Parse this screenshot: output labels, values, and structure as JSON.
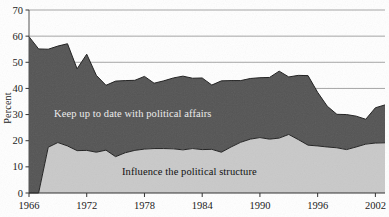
{
  "chart_data": {
    "type": "area",
    "stacked": true,
    "title": "",
    "subtitle": "",
    "xlabel": "",
    "ylabel": "Percent",
    "ylim": [
      0,
      70
    ],
    "ytick_step": 10,
    "yticks": [
      0,
      10,
      20,
      30,
      40,
      50,
      60,
      70
    ],
    "ytick_labels": [
      "0",
      "10",
      "20",
      "30",
      "40",
      "50",
      "60",
      "70"
    ],
    "xlim": [
      1966,
      2003
    ],
    "xticks": [
      1966,
      1972,
      1978,
      1984,
      1990,
      1996,
      2002
    ],
    "xtick_labels": [
      "1966",
      "1972",
      "1978",
      "1984",
      "1990",
      "1996",
      "2002"
    ],
    "grid": "horizontal-gridlines-at-40-50-60-70",
    "legend_position": "inline-annotations",
    "annotations": [
      {
        "text": "Keep up to date with political affairs",
        "color": "#ececec",
        "band": "upper"
      },
      {
        "text": "Influence the political structure",
        "color": "#111111",
        "band": "lower"
      }
    ],
    "x": [
      1966,
      1967,
      1968,
      1969,
      1970,
      1971,
      1972,
      1973,
      1974,
      1975,
      1976,
      1977,
      1978,
      1979,
      1980,
      1981,
      1982,
      1983,
      1984,
      1985,
      1986,
      1987,
      1988,
      1989,
      1990,
      1991,
      1992,
      1993,
      1994,
      1995,
      1996,
      1997,
      1998,
      1999,
      2000,
      2001,
      2002,
      2003
    ],
    "series": [
      {
        "name": "Influence the political structure",
        "color": "#c9c9c9",
        "values": [
          0,
          0,
          17.5,
          19.3,
          18.0,
          16.2,
          16.3,
          15.6,
          16.4,
          13.9,
          15.4,
          16.3,
          16.8,
          17.0,
          17.0,
          16.9,
          16.5,
          17.0,
          16.6,
          16.7,
          15.6,
          17.6,
          19.4,
          20.6,
          21.2,
          20.6,
          21.0,
          22.4,
          20.4,
          18.3,
          18.0,
          17.6,
          17.3,
          16.6,
          17.6,
          18.7,
          19.1,
          19.2
        ]
      },
      {
        "name": "Keep up to date with political affairs",
        "color": "#545454",
        "note": "plotted as total (top of stack) in the source figure",
        "values_total": [
          59.8,
          55.1,
          55.0,
          56.2,
          57.1,
          47.5,
          53.1,
          45.0,
          41.2,
          42.8,
          43.0,
          43.1,
          44.6,
          42.0,
          42.9,
          44.0,
          44.7,
          43.9,
          44.0,
          41.3,
          42.9,
          43.0,
          43.0,
          43.8,
          44.1,
          44.2,
          46.6,
          44.4,
          45.0,
          44.9,
          38.5,
          33.2,
          30.1,
          30.0,
          29.4,
          28.2,
          32.6,
          33.7
        ],
        "values": [
          59.8,
          55.1,
          37.5,
          36.9,
          39.1,
          31.3,
          36.8,
          29.4,
          24.8,
          28.9,
          27.6,
          26.8,
          27.8,
          25.0,
          25.9,
          27.1,
          28.2,
          26.9,
          27.4,
          24.6,
          27.3,
          25.4,
          23.6,
          23.2,
          22.9,
          23.6,
          25.6,
          22.0,
          24.6,
          26.6,
          20.5,
          15.6,
          12.8,
          13.4,
          11.8,
          9.5,
          13.5,
          14.5
        ]
      }
    ]
  },
  "axes": {
    "ylabel": "Percent"
  }
}
